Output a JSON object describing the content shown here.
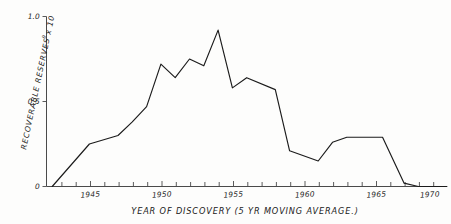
{
  "chart_data": {
    "type": "line",
    "title": "",
    "xlabel": "YEAR  OF DISCOVERY (5 YR MOVING AVERAGE.)",
    "ylabel": "RECOVERABLE  RESERVES x 10",
    "ylabel_exponent": "9",
    "xlim": [
      1943,
      1971
    ],
    "ylim": [
      0,
      1.0
    ],
    "grid": false,
    "legend": null,
    "x_tick_labels": [
      "1945",
      "1950",
      "1955",
      "1960",
      "1965",
      "1970"
    ],
    "x_tick_values": [
      1945,
      1950,
      1955,
      1960,
      1965,
      1970
    ],
    "x_minor_tick_interval": 1,
    "y_tick_labels": [
      "0",
      "0.5",
      "1.0"
    ],
    "y_tick_values": [
      0,
      0.5,
      1.0
    ],
    "series": [
      {
        "name": "Recoverable reserves",
        "x": [
          1943.4,
          1946.0,
          1948.0,
          1949.0,
          1950.0,
          1951.0,
          1952.0,
          1953.0,
          1954.0,
          1955.0,
          1956.0,
          1957.0,
          1959.0,
          1960.0,
          1962.0,
          1963.0,
          1964.0,
          1966.5,
          1968.0,
          1969.0,
          1971.0
        ],
        "values": [
          0.0,
          0.25,
          0.3,
          0.38,
          0.47,
          0.72,
          0.64,
          0.75,
          0.71,
          0.92,
          0.58,
          0.64,
          0.57,
          0.21,
          0.15,
          0.26,
          0.29,
          0.29,
          0.02,
          0.0,
          0.0
        ]
      }
    ],
    "colors": {
      "line": "#1b1b1b",
      "axis": "#4a4a4a",
      "background": "#fdfdfc"
    }
  },
  "axes": {
    "y_ticks": [
      {
        "label": "1.0",
        "value": 1.0
      },
      {
        "label": "0.5",
        "value": 0.5
      },
      {
        "label": "0",
        "value": 0.0
      }
    ],
    "x_ticks": [
      {
        "label": "1945",
        "value": 1945
      },
      {
        "label": "1950",
        "value": 1950
      },
      {
        "label": "1955",
        "value": 1955
      },
      {
        "label": "1960",
        "value": 1960
      },
      {
        "label": "1965",
        "value": 1965
      },
      {
        "label": "1970",
        "value": 1970
      }
    ]
  }
}
